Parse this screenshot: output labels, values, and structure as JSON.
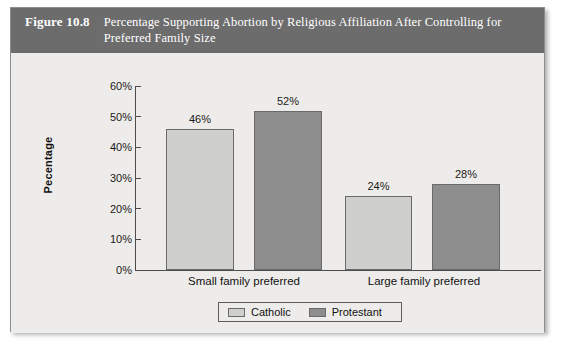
{
  "figure": {
    "number_label": "Figure 10.8",
    "caption": "Percentage Supporting Abortion by Religious Affiliation After Controlling for Preferred Family Size",
    "header_bg": "#6c6c6c",
    "panel_bg": "#eeecea"
  },
  "chart_data": {
    "type": "bar",
    "title": "Percentage Supporting Abortion by Religious Affiliation After Controlling for Preferred Family Size",
    "xlabel": "",
    "ylabel": "Pecentage",
    "categories": [
      "Small family preferred",
      "Large family preferred"
    ],
    "series": [
      {
        "name": "Catholic",
        "color": "#cfcfcd",
        "values": [
          46,
          52
        ]
      },
      {
        "name": "Protestant",
        "color": "#8e8e8e",
        "values": [
          24,
          28
        ]
      }
    ],
    "bars": [
      {
        "group": "Small family preferred",
        "series": "Catholic",
        "value": 46,
        "label": "46%",
        "color": "#cfcfcd"
      },
      {
        "group": "Small family preferred",
        "series": "Protestant",
        "value": 52,
        "label": "52%",
        "color": "#8e8e8e"
      },
      {
        "group": "Large family preferred",
        "series": "Catholic",
        "value": 24,
        "label": "24%",
        "color": "#cfcfcd"
      },
      {
        "group": "Large family preferred",
        "series": "Protestant",
        "value": 28,
        "label": "28%",
        "color": "#8e8e8e"
      }
    ],
    "ylim": [
      0,
      60
    ],
    "ytick_labels": [
      "60%",
      "50%",
      "40%",
      "30%",
      "20%",
      "10%",
      "0%"
    ],
    "ytick_values": [
      60,
      50,
      40,
      30,
      20,
      10,
      0
    ],
    "grid": false,
    "legend_position": "bottom-center",
    "legend": [
      {
        "label": "Catholic",
        "color": "#cfcfcd"
      },
      {
        "label": "Protestant",
        "color": "#8e8e8e"
      }
    ]
  }
}
